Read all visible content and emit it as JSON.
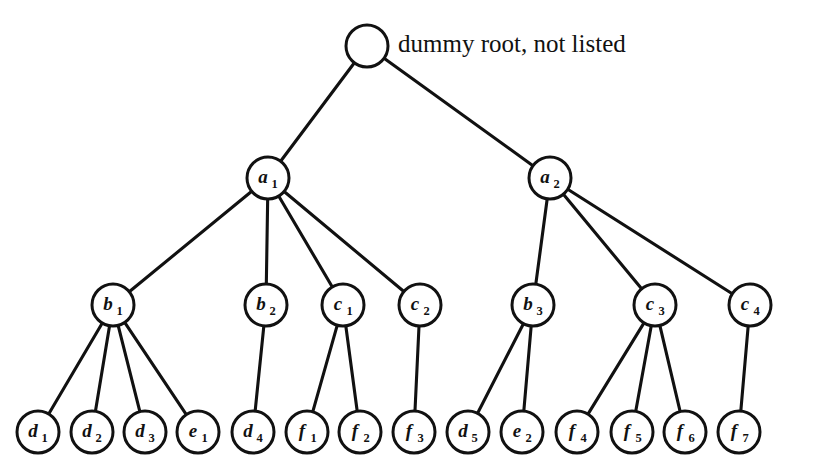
{
  "figure": {
    "kind": "tree-diagram",
    "background_color": "#ffffff",
    "line_color": "#111111",
    "text_color": "#111111",
    "width": 817,
    "height": 473
  },
  "annotations": [
    {
      "id": "root-caption",
      "text": "dummy root, not listed",
      "x": 398,
      "y": 46
    }
  ],
  "nodes": [
    {
      "id": "root",
      "base": "",
      "sub": "",
      "x": 367,
      "y": 46,
      "r": 21
    },
    {
      "id": "a1",
      "base": "a",
      "sub": "1",
      "x": 268,
      "y": 178,
      "r": 21
    },
    {
      "id": "a2",
      "base": "a",
      "sub": "2",
      "x": 550,
      "y": 178,
      "r": 21
    },
    {
      "id": "b1",
      "base": "b",
      "sub": "1",
      "x": 113,
      "y": 305,
      "r": 21
    },
    {
      "id": "b2",
      "base": "b",
      "sub": "2",
      "x": 266,
      "y": 305,
      "r": 21
    },
    {
      "id": "c1",
      "base": "c",
      "sub": "1",
      "x": 343,
      "y": 305,
      "r": 21
    },
    {
      "id": "c2",
      "base": "c",
      "sub": "2",
      "x": 420,
      "y": 305,
      "r": 21
    },
    {
      "id": "b3",
      "base": "b",
      "sub": "3",
      "x": 533,
      "y": 305,
      "r": 21
    },
    {
      "id": "c3",
      "base": "c",
      "sub": "3",
      "x": 655,
      "y": 305,
      "r": 21
    },
    {
      "id": "c4",
      "base": "c",
      "sub": "4",
      "x": 750,
      "y": 305,
      "r": 21
    },
    {
      "id": "d1",
      "base": "d",
      "sub": "1",
      "x": 38,
      "y": 432,
      "r": 21
    },
    {
      "id": "d2",
      "base": "d",
      "sub": "2",
      "x": 92,
      "y": 432,
      "r": 21
    },
    {
      "id": "d3",
      "base": "d",
      "sub": "3",
      "x": 145,
      "y": 432,
      "r": 21
    },
    {
      "id": "e1",
      "base": "e",
      "sub": "1",
      "x": 198,
      "y": 432,
      "r": 21
    },
    {
      "id": "d4",
      "base": "d",
      "sub": "4",
      "x": 253,
      "y": 432,
      "r": 21
    },
    {
      "id": "f1",
      "base": "f",
      "sub": "1",
      "x": 307,
      "y": 432,
      "r": 21
    },
    {
      "id": "f2",
      "base": "f",
      "sub": "2",
      "x": 360,
      "y": 432,
      "r": 21
    },
    {
      "id": "f3",
      "base": "f",
      "sub": "3",
      "x": 414,
      "y": 432,
      "r": 21
    },
    {
      "id": "d5",
      "base": "d",
      "sub": "5",
      "x": 468,
      "y": 432,
      "r": 21
    },
    {
      "id": "e2",
      "base": "e",
      "sub": "2",
      "x": 522,
      "y": 432,
      "r": 21
    },
    {
      "id": "f4",
      "base": "f",
      "sub": "4",
      "x": 577,
      "y": 432,
      "r": 21
    },
    {
      "id": "f5",
      "base": "f",
      "sub": "5",
      "x": 632,
      "y": 432,
      "r": 21
    },
    {
      "id": "f6",
      "base": "f",
      "sub": "6",
      "x": 685,
      "y": 432,
      "r": 21
    },
    {
      "id": "f7",
      "base": "f",
      "sub": "7",
      "x": 739,
      "y": 432,
      "r": 21
    }
  ],
  "edges": [
    {
      "from": "root",
      "to": "a1"
    },
    {
      "from": "root",
      "to": "a2"
    },
    {
      "from": "a1",
      "to": "b1"
    },
    {
      "from": "a1",
      "to": "b2"
    },
    {
      "from": "a1",
      "to": "c1"
    },
    {
      "from": "a1",
      "to": "c2"
    },
    {
      "from": "a2",
      "to": "b3"
    },
    {
      "from": "a2",
      "to": "c3"
    },
    {
      "from": "a2",
      "to": "c4"
    },
    {
      "from": "b1",
      "to": "d1"
    },
    {
      "from": "b1",
      "to": "d2"
    },
    {
      "from": "b1",
      "to": "d3"
    },
    {
      "from": "b1",
      "to": "e1"
    },
    {
      "from": "b2",
      "to": "d4"
    },
    {
      "from": "c1",
      "to": "f1"
    },
    {
      "from": "c1",
      "to": "f2"
    },
    {
      "from": "c2",
      "to": "f3"
    },
    {
      "from": "b3",
      "to": "d5"
    },
    {
      "from": "b3",
      "to": "e2"
    },
    {
      "from": "c3",
      "to": "f4"
    },
    {
      "from": "c3",
      "to": "f5"
    },
    {
      "from": "c3",
      "to": "f6"
    },
    {
      "from": "c4",
      "to": "f7"
    }
  ]
}
